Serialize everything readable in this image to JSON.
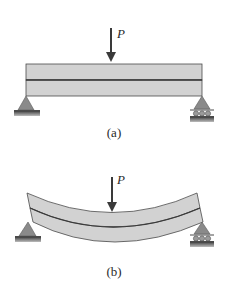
{
  "figure": {
    "panels": [
      {
        "id": "a",
        "caption": "(a)",
        "load_label": "P",
        "state": "undeformed",
        "description": "Two stacked beam layers on pin (left) and roller (right) supports under central point load P"
      },
      {
        "id": "b",
        "caption": "(b)",
        "load_label": "P",
        "state": "deflected",
        "description": "Two stacked beam layers bending downward and slipping relative to each other under central load P"
      }
    ],
    "colors": {
      "beam_fill": "#d2d2d2",
      "beam_stroke": "#4a4a4a",
      "support_fill": "#8a8a8a",
      "ground": "#6b6b6b",
      "text": "#2a2a2a"
    },
    "icons": {
      "left_support": "pin-support-icon",
      "right_support": "roller-support-icon",
      "load": "down-arrow-icon"
    }
  }
}
